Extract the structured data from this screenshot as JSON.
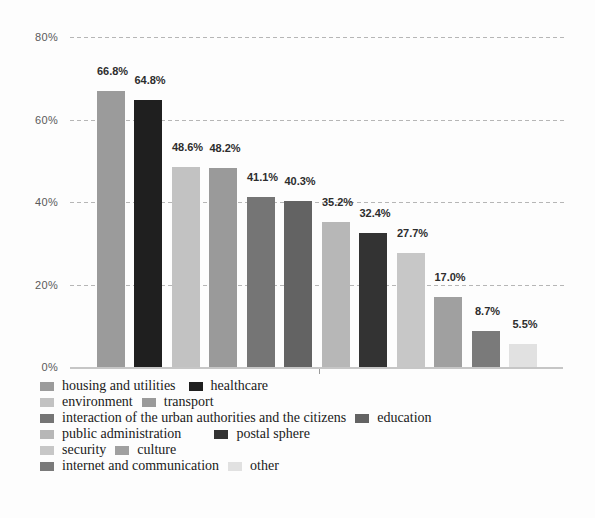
{
  "chart_data": {
    "type": "bar",
    "title": "",
    "xlabel": "",
    "ylabel": "",
    "ylim": [
      0,
      80
    ],
    "grid": "horizontal-dashed",
    "legend_position": "bottom",
    "categories": [
      "housing and utilities",
      "healthcare",
      "environment",
      "transport",
      "interaction of the urban authorities and the citizens",
      "education",
      "public administration",
      "postal sphere",
      "security",
      "culture",
      "internet and communication",
      "other"
    ],
    "values": [
      66.8,
      64.8,
      48.6,
      48.2,
      41.1,
      40.3,
      35.2,
      32.4,
      27.7,
      17.0,
      8.7,
      5.5
    ],
    "value_labels": [
      "66.8%",
      "64.8%",
      "48.6%",
      "48.2%",
      "41.1%",
      "40.3%",
      "35.2%",
      "32.4%",
      "27.7%",
      "17.0%",
      "8.7%",
      "5.5%"
    ],
    "bar_colors": [
      "#9b9b9b",
      "#1f1f1f",
      "#c2c2c2",
      "#9a9a9a",
      "#757575",
      "#636363",
      "#b7b7b7",
      "#333333",
      "#c7c7c7",
      "#a0a0a0",
      "#7a7a7a",
      "#e1e1e1"
    ],
    "yticks": [
      {
        "label": "80%",
        "value": 80
      },
      {
        "label": "60%",
        "value": 60
      },
      {
        "label": "40%",
        "value": 40
      },
      {
        "label": "20%",
        "value": 20
      },
      {
        "label": "0%",
        "value": 0
      }
    ]
  },
  "legend": {
    "rows": [
      [
        {
          "label": "housing and utilities",
          "color": "#9b9b9b"
        },
        {
          "label": "healthcare",
          "color": "#1f1f1f"
        }
      ],
      [
        {
          "label": "environment",
          "color": "#c2c2c2"
        },
        {
          "label": "transport",
          "color": "#9a9a9a"
        }
      ],
      [
        {
          "label": "interaction of the urban authorities and the citizens",
          "color": "#757575"
        },
        {
          "label": "education",
          "color": "#636363"
        }
      ],
      [
        {
          "label": "public administration",
          "color": "#b7b7b7"
        },
        {
          "label": "postal sphere",
          "color": "#333333"
        }
      ],
      [
        {
          "label": "security",
          "color": "#c7c7c7"
        },
        {
          "label": "culture",
          "color": "#a0a0a0"
        }
      ],
      [
        {
          "label": "internet and communication",
          "color": "#7a7a7a"
        },
        {
          "label": "other",
          "color": "#e1e1e1"
        }
      ]
    ]
  }
}
